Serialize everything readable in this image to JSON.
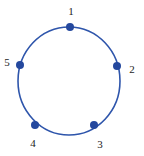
{
  "diagram": {
    "background_color": "#ffffff",
    "circle": {
      "cx": 69,
      "cy": 81,
      "rx": 51,
      "ry": 54,
      "stroke_color": "#2e55ab",
      "stroke_width": 1.6,
      "fill": "none"
    },
    "point_style": {
      "radius": 4,
      "fill_color": "#24489e"
    },
    "label_style": {
      "color": "#1c1c1c",
      "font_size": 11
    },
    "points": [
      {
        "label": "1",
        "cx": 70,
        "cy": 27,
        "label_x": 71,
        "label_y": 15,
        "label_anchor": "middle"
      },
      {
        "label": "2",
        "cx": 117,
        "cy": 66,
        "label_x": 132,
        "label_y": 73,
        "label_anchor": "middle"
      },
      {
        "label": "3",
        "cx": 94,
        "cy": 125,
        "label_x": 100,
        "label_y": 148,
        "label_anchor": "middle"
      },
      {
        "label": "4",
        "cx": 35,
        "cy": 125,
        "label_x": 33,
        "label_y": 147,
        "label_anchor": "middle"
      },
      {
        "label": "5",
        "cx": 20,
        "cy": 65,
        "label_x": 7,
        "label_y": 66,
        "label_anchor": "middle"
      }
    ]
  }
}
